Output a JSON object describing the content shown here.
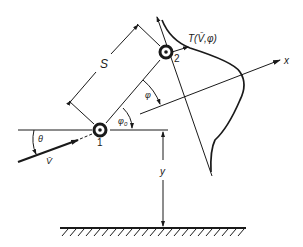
{
  "diagram": {
    "labels": {
      "separation": "S",
      "particle_1": "1",
      "particle_2": "2",
      "distribution": "T(V̄,φ)",
      "x_axis": "x",
      "height": "y",
      "incidence_angle": "θ",
      "velocity": "V̄",
      "angle_phi": "φ",
      "angle_phi0": "φ",
      "angle_phi0_sub": "0"
    },
    "colors": {
      "ink": "#1a1a1a",
      "background": "#ffffff"
    }
  }
}
